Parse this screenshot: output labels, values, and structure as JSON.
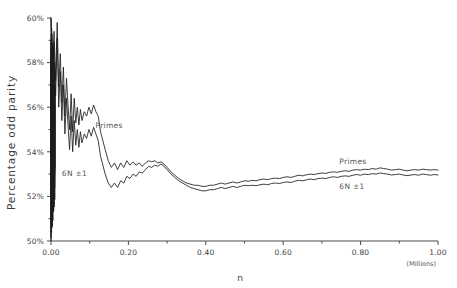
{
  "chart_data": {
    "type": "line",
    "title": "",
    "xlabel": "n",
    "ylabel": "Percentage  odd  parity",
    "x_units_note": "(Millions)",
    "xlim": [
      0.0,
      1.0
    ],
    "ylim": [
      50.0,
      60.0
    ],
    "x_tick_labels": [
      "0.00",
      "0.20",
      "0.40",
      "0.60",
      "0.80",
      "1.00"
    ],
    "x_tick_values": [
      0.0,
      0.2,
      0.4,
      0.6,
      0.8,
      1.0
    ],
    "x_minor_tick_values": [
      0.1,
      0.3,
      0.5,
      0.7,
      0.9
    ],
    "y_tick_labels": [
      "60%",
      "58%",
      "56%",
      "54%",
      "52%",
      "50%"
    ],
    "y_tick_values": [
      60,
      58,
      56,
      54,
      52,
      50
    ],
    "y_minor_tick_values": [
      59,
      57,
      55,
      53,
      51
    ],
    "grid": false,
    "legend_position": "inline-annotations",
    "annotations": [
      {
        "name": "primes-label-left",
        "text": "Primes",
        "x": 0.115,
        "y": 55.05
      },
      {
        "name": "six-n-label-left",
        "text": "6N ±1",
        "x": 0.028,
        "y": 52.92
      },
      {
        "name": "primes-label-right",
        "text": "Primes",
        "x": 0.745,
        "y": 53.45
      },
      {
        "name": "six-n-label-right",
        "text": "6N ±1",
        "x": 0.745,
        "y": 52.32
      }
    ],
    "series": [
      {
        "name": "Primes",
        "color": "#1c1c1c",
        "x": [
          0.0,
          0.004,
          0.008,
          0.012,
          0.016,
          0.02,
          0.024,
          0.028,
          0.032,
          0.036,
          0.04,
          0.044,
          0.048,
          0.052,
          0.056,
          0.06,
          0.064,
          0.068,
          0.072,
          0.076,
          0.08,
          0.086,
          0.092,
          0.098,
          0.104,
          0.11,
          0.116,
          0.122,
          0.128,
          0.134,
          0.14,
          0.148,
          0.156,
          0.164,
          0.172,
          0.18,
          0.188,
          0.196,
          0.204,
          0.212,
          0.22,
          0.228,
          0.236,
          0.244,
          0.252,
          0.26,
          0.268,
          0.276,
          0.284,
          0.292,
          0.3,
          0.31,
          0.32,
          0.33,
          0.34,
          0.35,
          0.36,
          0.37,
          0.38,
          0.39,
          0.4,
          0.41,
          0.42,
          0.43,
          0.44,
          0.45,
          0.46,
          0.47,
          0.48,
          0.49,
          0.5,
          0.51,
          0.52,
          0.53,
          0.54,
          0.55,
          0.56,
          0.57,
          0.58,
          0.59,
          0.6,
          0.61,
          0.62,
          0.63,
          0.64,
          0.65,
          0.66,
          0.67,
          0.68,
          0.69,
          0.7,
          0.71,
          0.72,
          0.73,
          0.74,
          0.75,
          0.76,
          0.77,
          0.78,
          0.79,
          0.8,
          0.81,
          0.82,
          0.83,
          0.84,
          0.85,
          0.86,
          0.87,
          0.88,
          0.89,
          0.9,
          0.91,
          0.92,
          0.93,
          0.94,
          0.95,
          0.96,
          0.97,
          0.98,
          0.99,
          1.0
        ],
        "y": [
          60.0,
          58.1,
          59.4,
          57.2,
          59.8,
          56.9,
          58.4,
          56.2,
          57.8,
          55.6,
          57.3,
          56.1,
          55.0,
          56.6,
          54.9,
          56.4,
          55.3,
          56.0,
          55.2,
          55.9,
          55.4,
          55.8,
          55.6,
          56.0,
          55.7,
          56.1,
          55.8,
          55.6,
          54.9,
          54.5,
          54.1,
          53.6,
          53.3,
          53.5,
          53.2,
          53.5,
          53.3,
          53.6,
          53.4,
          53.55,
          53.4,
          53.5,
          53.35,
          53.5,
          53.6,
          53.55,
          53.6,
          53.5,
          53.55,
          53.45,
          53.3,
          53.1,
          52.95,
          52.8,
          52.7,
          52.6,
          52.55,
          52.5,
          52.5,
          52.45,
          52.45,
          52.5,
          52.5,
          52.55,
          52.6,
          52.55,
          52.6,
          52.65,
          52.6,
          52.65,
          52.7,
          52.68,
          52.72,
          52.7,
          52.75,
          52.78,
          52.75,
          52.8,
          52.82,
          52.8,
          52.85,
          52.88,
          52.85,
          52.9,
          52.95,
          52.92,
          52.97,
          53.0,
          52.98,
          53.02,
          53.05,
          53.03,
          53.08,
          53.1,
          53.08,
          53.12,
          53.15,
          53.12,
          53.18,
          53.2,
          53.18,
          53.22,
          53.2,
          53.25,
          53.22,
          53.28,
          53.25,
          53.22,
          53.18,
          53.2,
          53.22,
          53.18,
          53.15,
          53.18,
          53.2,
          53.18,
          53.22,
          53.2,
          53.18,
          53.2,
          53.18
        ]
      },
      {
        "name": "6N ±1",
        "color": "#1c1c1c",
        "x": [
          0.0,
          0.004,
          0.008,
          0.012,
          0.016,
          0.02,
          0.024,
          0.028,
          0.032,
          0.036,
          0.04,
          0.044,
          0.048,
          0.052,
          0.056,
          0.06,
          0.064,
          0.068,
          0.072,
          0.076,
          0.08,
          0.086,
          0.092,
          0.098,
          0.104,
          0.11,
          0.116,
          0.122,
          0.128,
          0.134,
          0.14,
          0.148,
          0.156,
          0.164,
          0.172,
          0.18,
          0.188,
          0.196,
          0.204,
          0.212,
          0.22,
          0.228,
          0.236,
          0.244,
          0.252,
          0.26,
          0.268,
          0.276,
          0.284,
          0.292,
          0.3,
          0.31,
          0.32,
          0.33,
          0.34,
          0.35,
          0.36,
          0.37,
          0.38,
          0.39,
          0.4,
          0.41,
          0.42,
          0.43,
          0.44,
          0.45,
          0.46,
          0.47,
          0.48,
          0.49,
          0.5,
          0.51,
          0.52,
          0.53,
          0.54,
          0.55,
          0.56,
          0.57,
          0.58,
          0.59,
          0.6,
          0.61,
          0.62,
          0.63,
          0.64,
          0.65,
          0.66,
          0.67,
          0.68,
          0.69,
          0.7,
          0.71,
          0.72,
          0.73,
          0.74,
          0.75,
          0.76,
          0.77,
          0.78,
          0.79,
          0.8,
          0.81,
          0.82,
          0.83,
          0.84,
          0.85,
          0.86,
          0.87,
          0.88,
          0.89,
          0.9,
          0.91,
          0.92,
          0.93,
          0.94,
          0.95,
          0.96,
          0.97,
          0.98,
          0.99,
          1.0
        ],
        "y": [
          60.0,
          57.6,
          58.9,
          56.5,
          59.1,
          56.0,
          57.6,
          55.4,
          57.0,
          54.8,
          56.4,
          55.2,
          54.1,
          55.6,
          54.0,
          55.4,
          54.3,
          55.0,
          54.2,
          54.9,
          54.4,
          54.8,
          54.6,
          55.0,
          54.7,
          55.1,
          54.8,
          54.5,
          53.8,
          53.4,
          53.0,
          52.6,
          52.4,
          52.6,
          52.4,
          52.7,
          52.6,
          52.9,
          52.8,
          53.0,
          52.9,
          53.1,
          53.05,
          53.2,
          53.35,
          53.3,
          53.4,
          53.35,
          53.45,
          53.35,
          53.2,
          53.0,
          52.85,
          52.7,
          52.6,
          52.5,
          52.4,
          52.35,
          52.3,
          52.25,
          52.25,
          52.3,
          52.3,
          52.35,
          52.4,
          52.35,
          52.4,
          52.45,
          52.4,
          52.45,
          52.5,
          52.48,
          52.5,
          52.48,
          52.52,
          52.55,
          52.52,
          52.58,
          52.6,
          52.58,
          52.62,
          52.65,
          52.62,
          52.68,
          52.72,
          52.7,
          52.74,
          52.78,
          52.75,
          52.8,
          52.82,
          52.8,
          52.85,
          52.88,
          52.85,
          52.9,
          52.92,
          52.9,
          52.95,
          52.98,
          52.95,
          53.0,
          52.98,
          53.02,
          53.0,
          53.05,
          53.02,
          53.0,
          52.96,
          52.98,
          53.0,
          52.96,
          52.93,
          52.96,
          52.98,
          52.95,
          53.0,
          52.98,
          52.95,
          52.98,
          52.96
        ]
      }
    ],
    "left_spike": {
      "name": "dense-initial-oscillation",
      "note": "Very dense high-amplitude oscillation between 50% and 60% in the first ~0.01 of the x range"
    }
  }
}
